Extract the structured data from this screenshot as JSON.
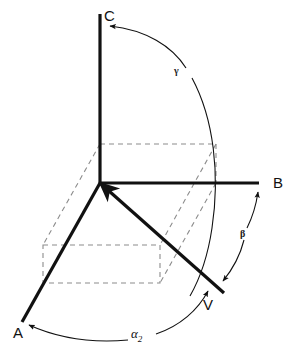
{
  "figure": {
    "type": "technical-line-diagram",
    "background_color": "#ffffff",
    "line_color": "#111111",
    "dashed_color": "#8c8c8c"
  },
  "axes": [
    {
      "id": "axis-a",
      "label": "A",
      "label_x": 14,
      "label_y": 337,
      "from": [
        100,
        183
      ],
      "to": [
        22,
        322
      ],
      "stroke_width": 3.2,
      "style": "solid"
    },
    {
      "id": "axis-b",
      "label": "B",
      "label_x": 273,
      "label_y": 186,
      "from": [
        100,
        183
      ],
      "to": [
        259,
        183
      ],
      "stroke_width": 3.2,
      "style": "solid"
    },
    {
      "id": "axis-c",
      "label": "C",
      "label_x": 104,
      "label_y": 21,
      "from": [
        100,
        183
      ],
      "to": [
        100,
        14
      ],
      "stroke_width": 3.2,
      "style": "solid"
    }
  ],
  "vector": {
    "id": "vector-v",
    "label": "V",
    "label_x": 205,
    "label_y": 307,
    "from": [
      224,
      293
    ],
    "to": [
      100,
      183
    ],
    "stroke_width": 3.2,
    "arrow_at": "origin"
  },
  "angles": [
    {
      "id": "angle-gamma",
      "label": "γ",
      "label_x": 178,
      "label_y": 72,
      "description": "arc from C axis sweeping to vector V",
      "arrow_target": "C axis"
    },
    {
      "id": "angle-beta",
      "label": "β",
      "label_x": 243,
      "label_y": 235,
      "description": "arc from B axis down to vector V",
      "arrow_target": "B axis"
    },
    {
      "id": "angle-alpha-2",
      "label": "α",
      "subscript": "2",
      "label_x": 139,
      "label_y": 336,
      "description": "arc from A axis to vector V",
      "arrow_target": "A axis"
    }
  ],
  "dashed_box": {
    "id": "projection-box",
    "description": "dashed parallelepiped showing vector components along A, B and C axes",
    "style": "dashed",
    "dash_pattern": "5,4"
  }
}
